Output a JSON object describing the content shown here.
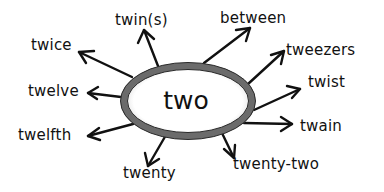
{
  "center": {
    "label": "two",
    "ellipse_stroke_color": "#6b6b6b",
    "ellipse_fill_color": "#ffffff"
  },
  "words": [
    {
      "id": "twins",
      "label": "twin(s)"
    },
    {
      "id": "twice",
      "label": "twice"
    },
    {
      "id": "twelve",
      "label": "twelve"
    },
    {
      "id": "twelfth",
      "label": "twelfth"
    },
    {
      "id": "twenty",
      "label": "twenty"
    },
    {
      "id": "between",
      "label": "between"
    },
    {
      "id": "tweezers",
      "label": "tweezers"
    },
    {
      "id": "twist",
      "label": "twist"
    },
    {
      "id": "twain",
      "label": "twain"
    },
    {
      "id": "twenty-two",
      "label": "twenty-two"
    }
  ],
  "colors": {
    "arrow": "#111111",
    "text": "#111111",
    "background": "#ffffff"
  }
}
